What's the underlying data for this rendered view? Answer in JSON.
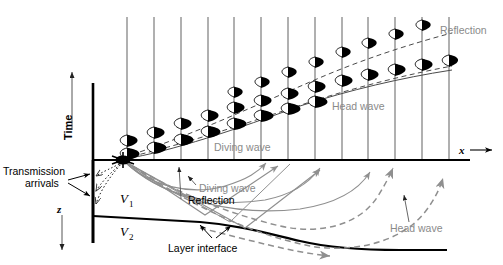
{
  "figure": {
    "type": "seismic-raypath-and-seismogram-diagram",
    "background": "#ffffff",
    "width": 503,
    "height": 265
  },
  "colors": {
    "axis": "#000000",
    "trace": "#6b6b6b",
    "wavelet_fill": "#000000",
    "wavelet_outline": "#000000",
    "gray_label": "#8a8a8a",
    "black_label": "#000000",
    "ray_gray": "#8f8f8f",
    "ray_dark": "#555555",
    "interface": "#000000",
    "dashed_event": "#4a4a4a"
  },
  "axes": {
    "time_axis": {
      "label": "Time",
      "direction": "up",
      "orientation": "vertical",
      "arrow": "↑"
    },
    "depth_axis": {
      "label": "z",
      "direction": "down",
      "orientation": "vertical",
      "arrow": "↓"
    },
    "offset_axis": {
      "label": "x",
      "direction": "right",
      "orientation": "horizontal",
      "arrow": "→"
    }
  },
  "velocities": [
    {
      "label": "V",
      "subscript": "1",
      "region": "upper-layer"
    },
    {
      "label": "V",
      "subscript": "2",
      "region": "lower-layer"
    }
  ],
  "labels": {
    "transmission_arrivals": "Transmission\narrivals",
    "transmission_arrivals_line1": "Transmission",
    "transmission_arrivals_line2": "arrivals",
    "diving_wave_upper": "Diving wave",
    "diving_wave_lower": "Diving wave",
    "head_wave_upper": "Head wave",
    "head_wave_lower": "Head wave",
    "reflection_upper": "Reflection",
    "reflection_lower": "Reflection",
    "layer_interface": "Layer interface"
  },
  "seismogram": {
    "n_traces": 13,
    "first_trace_x": 127,
    "trace_spacing": 26.8,
    "trace_top_y": 17,
    "trace_bottom_y": 160,
    "events": [
      {
        "name": "diving-wave",
        "style": "solid",
        "label": "Diving wave",
        "arrival_times_y": [
          158,
          152,
          144,
          136,
          128,
          120,
          113,
          106,
          100,
          95,
          90,
          86,
          82
        ]
      },
      {
        "name": "head-wave",
        "style": "dashed",
        "label": "Head wave",
        "arrival_times_y": [
          157,
          148,
          139,
          131,
          123,
          115,
          108,
          101,
          95,
          89,
          84,
          79,
          75
        ]
      },
      {
        "name": "reflection",
        "style": "dashed",
        "label": "Reflection",
        "arrival_times_y": [
          156,
          143,
          131,
          120,
          110,
          100,
          91,
          82,
          74,
          66,
          58,
          50,
          43
        ]
      }
    ]
  },
  "model": {
    "surface_y": 160,
    "source": {
      "x": 123,
      "y": 160,
      "name": "source-point"
    },
    "interface": {
      "name": "layer-interface",
      "description": "dipping boundary between V1 and V2"
    },
    "raypaths": [
      {
        "name": "diving-wave-ray",
        "style": "solid-gray",
        "count": 4
      },
      {
        "name": "reflection-ray",
        "style": "solid-gray",
        "count": 3
      },
      {
        "name": "head-wave-ray",
        "style": "dashed-gray",
        "count": 3
      },
      {
        "name": "transmission-ray",
        "style": "dotted-black",
        "count": 3
      }
    ]
  }
}
